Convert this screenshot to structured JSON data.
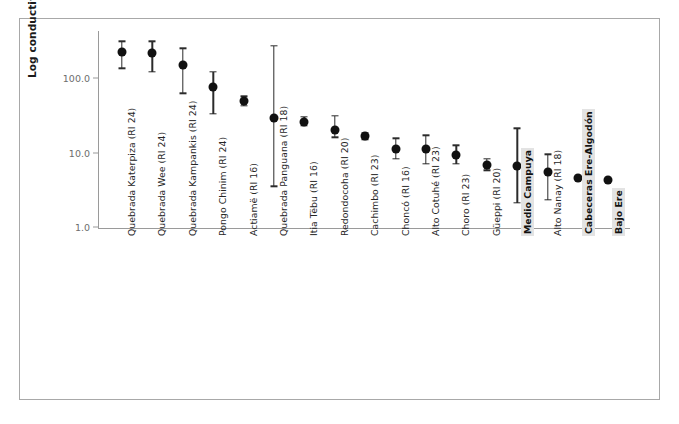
{
  "figure": {
    "top_fragment": "",
    "axis_color": "#9a9a9a",
    "point_color": "#111111",
    "highlight_color": "#e3e3e3"
  },
  "chart_data": {
    "type": "scatter",
    "title": "",
    "xlabel": "",
    "ylabel": "Log conductivity (µS/cm)",
    "yscale": "log",
    "ylim": [
      1.0,
      400.0
    ],
    "yticks": [
      1.0,
      10.0,
      100.0
    ],
    "ytick_labels": [
      "1.0",
      "10.0",
      "100.0"
    ],
    "grid": false,
    "legend": "none",
    "error_bars": "vertical with caps",
    "categories": [
      "Quebrada Katerpiza (RI 24)",
      "Quebrada Wee (RI 24)",
      "Quebrada Kampankis (RI 24)",
      "Pongo Chinim (RI 24)",
      "Actiamë (RI 16)",
      "Quebrada Panguana (RI 18)",
      "Itia Tëbu (RI 16)",
      "Redondocoha (RI 20)",
      "Cachimbo (RI 23)",
      "Choncó (RI 16)",
      "Alto Cotuhé (RI 23)",
      "Choro (RI 23)",
      "Güeppi (RI 20)",
      "Medio Campuya",
      "Alto Nanay (RI 18)",
      "Cabeceras Ere-Algodón",
      "Bajo Ere"
    ],
    "highlighted": [
      "Medio Campuya",
      "Cabeceras Ere-Algodón",
      "Bajo Ere"
    ],
    "values": [
      220,
      215,
      150,
      76,
      49,
      29,
      26,
      20,
      16.5,
      11,
      11,
      9.3,
      6.8,
      6.6,
      5.5,
      4.5,
      4.3
    ],
    "err_low": [
      135,
      120,
      62,
      33,
      42,
      3.5,
      23,
      16,
      15,
      8.2,
      7.1,
      7.1,
      5.8,
      2.1,
      2.3,
      null,
      null
    ],
    "err_high": [
      310,
      310,
      250,
      120,
      57,
      270,
      30,
      31,
      18.5,
      15.5,
      17,
      12.5,
      8.3,
      21,
      9.5,
      null,
      null
    ]
  },
  "yaxis": {
    "ticks": [
      {
        "label": "100.0",
        "value": 100.0
      },
      {
        "label": "10.0",
        "value": 10.0
      },
      {
        "label": "1.0",
        "value": 1.0
      }
    ]
  }
}
